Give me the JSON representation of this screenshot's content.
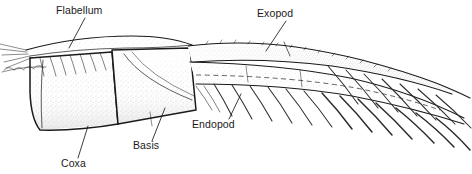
{
  "figure": {
    "background_color": "#ffffff",
    "ink_color": "#1a1a1a",
    "stipple_color": "#9a9a9a",
    "width": 472,
    "height": 174,
    "style": "stippled scientific line illustration"
  },
  "labels": [
    {
      "id": "flabellum",
      "text": "Flabellum",
      "text_x": 56,
      "text_y": 14,
      "anchor": "start",
      "leader": {
        "x1": 85,
        "y1": 18,
        "x2": 69,
        "y2": 48
      }
    },
    {
      "id": "exopod",
      "text": "Exopod",
      "text_x": 257,
      "text_y": 17,
      "anchor": "start",
      "leader": {
        "x1": 286,
        "y1": 21,
        "x2": 266,
        "y2": 51
      }
    },
    {
      "id": "endopod",
      "text": "Endopod",
      "text_x": 192,
      "text_y": 128,
      "anchor": "start",
      "leader": {
        "x1": 229,
        "y1": 119,
        "x2": 241,
        "y2": 94
      }
    },
    {
      "id": "basis",
      "text": "Basis",
      "text_x": 133,
      "text_y": 149,
      "anchor": "start",
      "leader": {
        "x1": 152,
        "y1": 141,
        "x2": 165,
        "y2": 108
      }
    },
    {
      "id": "coxa",
      "text": "Coxa",
      "text_x": 61,
      "text_y": 167,
      "anchor": "start",
      "leader": {
        "x1": 78,
        "y1": 158,
        "x2": 88,
        "y2": 126
      }
    }
  ],
  "segments": [
    {
      "id": "coxa-segment",
      "name": "Coxa"
    },
    {
      "id": "basis-segment",
      "name": "Basis"
    },
    {
      "id": "endopod-segment",
      "name": "Endopod"
    },
    {
      "id": "exopod-segment",
      "name": "Exopod"
    },
    {
      "id": "flabellum-segment",
      "name": "Flabellum"
    }
  ]
}
